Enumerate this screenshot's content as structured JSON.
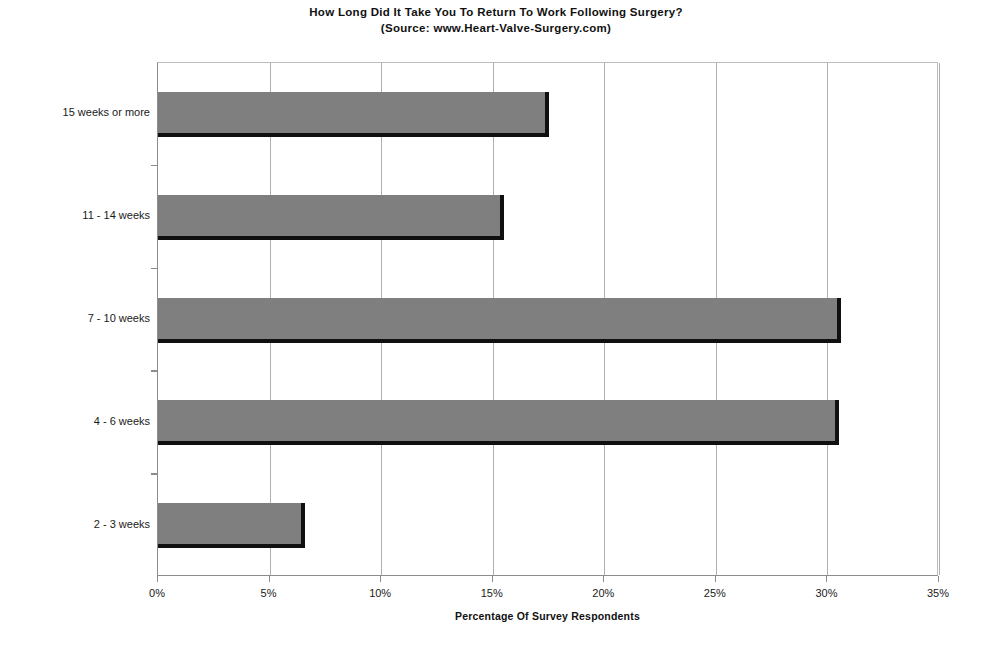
{
  "chart_data": {
    "type": "bar",
    "orientation": "horizontal",
    "title": "How Long Did It Take You To Return To Work Following Surgery?",
    "subtitle": "(Source: www.Heart-Valve-Surgery.com)",
    "categories": [
      "2 - 3 weeks",
      "4 - 6 weeks",
      "7 - 10 weeks",
      "11 - 14 weeks",
      "15 weeks or more"
    ],
    "values": [
      6.6,
      30.5,
      30.6,
      15.5,
      17.5
    ],
    "xlabel": "Percentage Of Survey Respondents",
    "ylabel": "",
    "xlim": [
      0,
      35
    ],
    "xticks": [
      0,
      5,
      10,
      15,
      20,
      25,
      30,
      35
    ],
    "xtick_labels": [
      "0%",
      "5%",
      "10%",
      "15%",
      "20%",
      "25%",
      "30%",
      "35%"
    ],
    "grid": "vertical",
    "legend": "none",
    "bar_color": "#7f7f7f",
    "bar_shadow_color": "#101010",
    "gridline_color": "#b0b0b0",
    "axis_color": "#8c8c8c"
  }
}
